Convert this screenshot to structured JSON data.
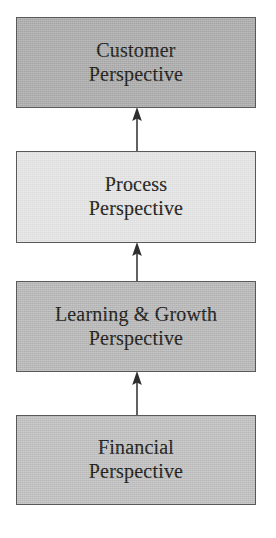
{
  "diagram": {
    "type": "vertical-flow",
    "canvas": {
      "width": 276,
      "height": 538,
      "background": "#ffffff"
    },
    "text_color": "#151515",
    "border_color": "#595959",
    "arrow_color": "#3a3a3a",
    "nodes": [
      {
        "id": "customer",
        "name": "customer-perspective",
        "line1": "Customer",
        "line2": "Perspective",
        "fill": "#a8a8a8",
        "x": 16,
        "y": 17,
        "width": 240,
        "height": 91
      },
      {
        "id": "process",
        "name": "process-perspective",
        "line1": "Process",
        "line2": "Perspective",
        "fill": "#e3e3e3",
        "x": 16,
        "y": 151,
        "width": 240,
        "height": 92
      },
      {
        "id": "learning-growth",
        "name": "learning-and-growth-perspective",
        "line1": "Learning & Growth",
        "line2": "Perspective",
        "fill": "#b5b5b5",
        "x": 16,
        "y": 281,
        "width": 240,
        "height": 91
      },
      {
        "id": "financial",
        "name": "financial-perspective",
        "line1": "Financial",
        "line2": "Perspective",
        "fill": "#bdbdbd",
        "x": 16,
        "y": 415,
        "width": 240,
        "height": 90
      }
    ],
    "arrows": [
      {
        "id": "financial-to-learning",
        "from": "financial",
        "to": "learning-growth",
        "x": 137,
        "y_tail": 415,
        "y_head": 372
      },
      {
        "id": "learning-to-process",
        "from": "learning-growth",
        "to": "process",
        "x": 137,
        "y_tail": 281,
        "y_head": 243
      },
      {
        "id": "process-to-customer",
        "from": "process",
        "to": "customer",
        "x": 137,
        "y_tail": 151,
        "y_head": 108
      }
    ]
  }
}
